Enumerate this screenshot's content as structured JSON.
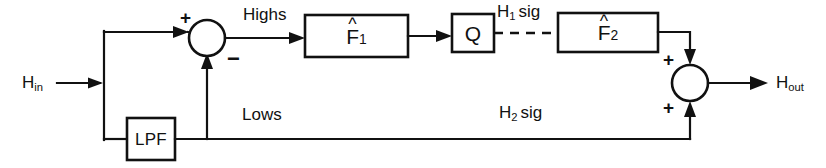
{
  "diagram": {
    "type": "signal-flow-block-diagram",
    "background_color": "#ffffff",
    "line_color": "#111111"
  },
  "ports": {
    "input": {
      "base": "H",
      "subscript": "in",
      "label": "Hin",
      "x": 22,
      "y": 74
    },
    "output": {
      "base": "H",
      "subscript": "out",
      "label": "Hout",
      "x": 776,
      "y": 74
    }
  },
  "signals": [
    {
      "name": "highs-label",
      "text": "Highs",
      "x": 243,
      "y": 6
    },
    {
      "name": "lows-label",
      "text": "Lows",
      "x": 242,
      "y": 106
    },
    {
      "name": "h1sig-label",
      "base": "H",
      "subscript": "1",
      "suffix": "sig",
      "text": "H1 sig",
      "x": 497,
      "y": 3
    },
    {
      "name": "h2sig-label",
      "base": "H",
      "subscript": "2",
      "suffix": "sig",
      "text": "H2 sig",
      "x": 499,
      "y": 104
    }
  ],
  "blocks": [
    {
      "name": "f1-hat-block",
      "label": "F1",
      "base": "F",
      "subscript": "1",
      "has_hat": true,
      "x": 305,
      "y": 15,
      "width": 103,
      "height": 42
    },
    {
      "name": "quantizer-block",
      "label": "Q",
      "base": "Q",
      "subscript": "",
      "has_hat": false,
      "x": 452,
      "y": 14,
      "width": 42,
      "height": 38
    },
    {
      "name": "f2-hat-block",
      "label": "F2",
      "base": "F",
      "subscript": "2",
      "has_hat": true,
      "x": 558,
      "y": 13,
      "width": 100,
      "height": 39
    },
    {
      "name": "lpf-block",
      "label": "LPF",
      "base": "LPF",
      "subscript": "",
      "has_hat": false,
      "x": 127,
      "y": 118,
      "width": 48,
      "height": 42
    }
  ],
  "summing_junctions": [
    {
      "name": "input-summing-junction",
      "cx": 207,
      "cy": 38,
      "r": 18,
      "signs": [
        {
          "symbol": "+",
          "position": "top-left",
          "x": 180,
          "y": 10
        },
        {
          "symbol": "−",
          "position": "bottom-right",
          "x": 226,
          "y": 52
        }
      ]
    },
    {
      "name": "output-summing-junction",
      "cx": 690,
      "cy": 83,
      "r": 18,
      "signs": [
        {
          "symbol": "+",
          "position": "top-left",
          "x": 663,
          "y": 52
        },
        {
          "symbol": "+",
          "position": "bottom-left",
          "x": 663,
          "y": 100
        }
      ]
    }
  ],
  "connections": [
    {
      "name": "input-to-tap",
      "style": "solid",
      "arrow": true
    },
    {
      "name": "tap-to-sum1-top",
      "style": "solid",
      "arrow": true
    },
    {
      "name": "tap-to-lpf",
      "style": "solid",
      "arrow": false
    },
    {
      "name": "lpf-to-lows-bus",
      "style": "solid",
      "arrow": false
    },
    {
      "name": "lows-bus-to-sum1-minus",
      "style": "solid",
      "arrow": true
    },
    {
      "name": "sum1-to-f1",
      "style": "solid",
      "arrow": true
    },
    {
      "name": "f1-to-quantizer",
      "style": "solid",
      "arrow": true
    },
    {
      "name": "quantizer-to-f2",
      "style": "dashed",
      "arrow": false
    },
    {
      "name": "f2-to-sum2-plus",
      "style": "solid",
      "arrow": true
    },
    {
      "name": "lows-bus-to-sum2-plus",
      "style": "solid",
      "arrow": true
    },
    {
      "name": "sum2-to-output",
      "style": "solid",
      "arrow": true
    }
  ]
}
